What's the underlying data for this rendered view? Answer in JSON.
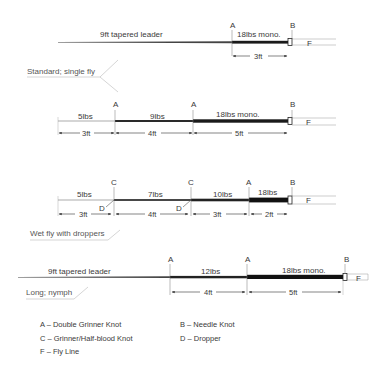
{
  "diagrams": [
    {
      "id": "standard",
      "caption": "Standard; single fly",
      "sections": [
        {
          "label": "9ft tapered leader"
        },
        {
          "label": "18lbs mono."
        }
      ],
      "knots": [
        "A",
        "B"
      ],
      "fly_line_label": "F",
      "dimensions": [
        "3ft"
      ]
    },
    {
      "id": "three-section",
      "caption": "",
      "sections": [
        {
          "label": "5lbs"
        },
        {
          "label": "9lbs"
        },
        {
          "label": "18lbs mono."
        }
      ],
      "knots": [
        "A",
        "A",
        "B"
      ],
      "fly_line_label": "F",
      "dimensions": [
        "3ft",
        "4ft",
        "5ft"
      ]
    },
    {
      "id": "wet-fly-droppers",
      "caption": "Wet fly with droppers",
      "sections": [
        {
          "label": "5lbs"
        },
        {
          "label": "7lbs"
        },
        {
          "label": "10lbs"
        },
        {
          "label": "18lbs"
        }
      ],
      "knots": [
        "C",
        "C",
        "A",
        "B"
      ],
      "droppers": [
        "D",
        "D"
      ],
      "fly_line_label": "F",
      "dimensions": [
        "3ft",
        "4ft",
        "3ft",
        "2ft"
      ]
    },
    {
      "id": "long-nymph",
      "caption": "Long; nymph",
      "sections": [
        {
          "label": "9ft tapered leader"
        },
        {
          "label": "12lbs"
        },
        {
          "label": "18lbs mono."
        }
      ],
      "knots": [
        "A",
        "A",
        "B"
      ],
      "fly_line_label": "F",
      "dimensions": [
        "4ft",
        "5ft"
      ]
    }
  ],
  "legend": [
    {
      "text": "A – Double Grinner Knot"
    },
    {
      "text": "B – Needle Knot"
    },
    {
      "text": "C – Grinner/Half-blood Knot"
    },
    {
      "text": "D – Dropper"
    },
    {
      "text": "F – Fly Line"
    }
  ],
  "colors": {
    "line": "#1a1a1a",
    "thin_line": "#8a8a8a",
    "text": "#3a3a3a"
  }
}
